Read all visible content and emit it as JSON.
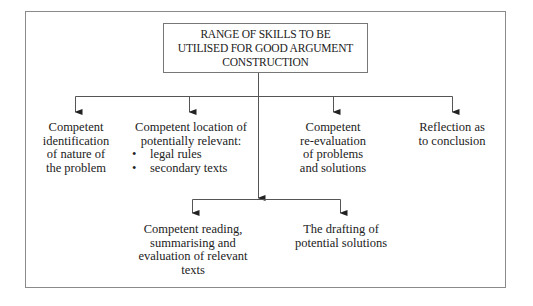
{
  "diagram": {
    "title": {
      "lines": [
        "RANGE OF SKILLS TO BE",
        "UTILISED FOR GOOD ARGUMENT",
        "CONSTRUCTION"
      ]
    },
    "top_nodes": [
      {
        "lines": [
          "Competent",
          "identification",
          "of nature of",
          "the problem"
        ]
      },
      {
        "lines": [
          "Competent location of",
          "potentially relevant:"
        ],
        "bullets": [
          "legal rules",
          "secondary texts"
        ]
      },
      {
        "lines": [
          "Competent",
          "re-evaluation",
          "of problems",
          "and solutions"
        ]
      },
      {
        "lines": [
          "Reflection as",
          "to conclusion"
        ]
      }
    ],
    "bottom_nodes": [
      {
        "lines": [
          "Competent reading,",
          "summarising and",
          "evaluation of relevant",
          "texts"
        ]
      },
      {
        "lines": [
          "The drafting of",
          "potential solutions"
        ]
      }
    ],
    "bullet_glyph": "•",
    "colors": {
      "line": "#555555",
      "frame": "#8a8a8a",
      "text": "#222222"
    }
  }
}
